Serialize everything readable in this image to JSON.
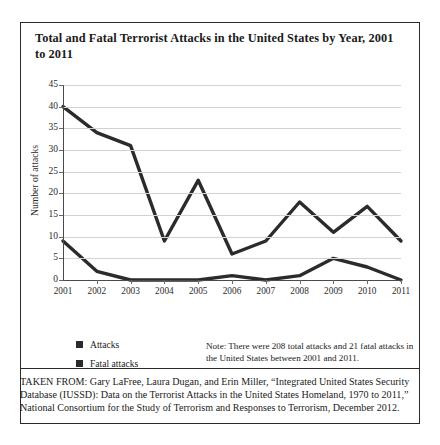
{
  "figure": {
    "title": "Total and Fatal Terrorist Attacks in the United States by Year, 2001 to 2011",
    "note": "Note: There were 208 total attacks and 21 fatal attacks in the United States between 2001 and 2011.",
    "source": "TAKEN FROM: Gary LaFree, Laura Dugan, and Erin Miller, “Integrated United States Security Database (IUSSD): Data on the Terrorist Attacks in the United States Homeland, 1970 to 2011,” National Consortium for the Study of Terrorism and Responses to Terrorism, December 2012."
  },
  "chart_data": {
    "type": "line",
    "title": "Total and Fatal Terrorist Attacks in the United States by Year, 2001 to 2011",
    "xlabel": "",
    "ylabel": "Number of attacks",
    "categories": [
      "2001",
      "2002",
      "2003",
      "2004",
      "2005",
      "2006",
      "2007",
      "2008",
      "2009",
      "2010",
      "2011"
    ],
    "series": [
      {
        "name": "Attacks",
        "values": [
          40,
          34,
          31,
          9,
          23,
          6,
          9,
          18,
          11,
          17,
          9
        ],
        "color": "#2b2b2b"
      },
      {
        "name": "Fatal attacks",
        "values": [
          9,
          2,
          0,
          0,
          0,
          1,
          0,
          1,
          5,
          3,
          0
        ],
        "color": "#2b2b2b"
      }
    ],
    "ylim": [
      0,
      45
    ],
    "yticks": [
      0,
      5,
      10,
      15,
      20,
      25,
      30,
      35,
      40,
      45
    ],
    "grid": true,
    "legend_position": "bottom-left"
  }
}
